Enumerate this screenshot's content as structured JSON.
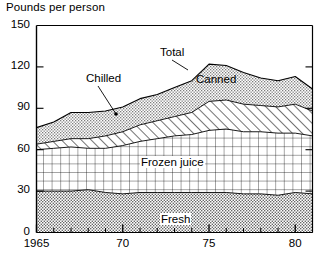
{
  "chart_data": {
    "type": "area",
    "title": "Pounds per person",
    "xlabel": "",
    "ylabel": "Pounds per person",
    "ylim": [
      0,
      150
    ],
    "xlim": [
      1965,
      1981
    ],
    "y_ticks": [
      0,
      30,
      60,
      90,
      120,
      150
    ],
    "x_ticks": [
      1965,
      1970,
      1975,
      1980
    ],
    "x_tick_labels": [
      "1965",
      "70",
      "75",
      "80"
    ],
    "x_minor_tick_interval": 1,
    "grid": false,
    "stacked": true,
    "legend": "inline-annotations",
    "x": [
      1965,
      1966,
      1967,
      1968,
      1969,
      1970,
      1971,
      1972,
      1973,
      1974,
      1975,
      1976,
      1977,
      1978,
      1979,
      1980,
      1981
    ],
    "series": [
      {
        "name": "Fresh",
        "pattern": "dotted",
        "values": [
          30,
          30,
          30,
          31,
          29,
          28,
          29,
          29,
          29,
          29,
          29,
          29,
          28,
          28,
          27,
          29,
          28
        ]
      },
      {
        "name": "Frozen juice",
        "pattern": "grid",
        "values": [
          30,
          31,
          32,
          30,
          32,
          35,
          37,
          39,
          41,
          42,
          45,
          46,
          45,
          45,
          45,
          43,
          42
        ]
      },
      {
        "name": "Chilled",
        "pattern": "diagonal-hatch",
        "values": [
          4,
          5,
          6,
          7,
          9,
          10,
          12,
          13,
          14,
          16,
          21,
          21,
          20,
          19,
          19,
          21,
          18
        ]
      },
      {
        "name": "Canned",
        "pattern": "stipple",
        "values": [
          12,
          14,
          19,
          19,
          18,
          18,
          19,
          19,
          21,
          23,
          27,
          25,
          23,
          20,
          19,
          20,
          16
        ]
      }
    ],
    "cumulative_total": {
      "name": "Total",
      "values": [
        76,
        80,
        87,
        87,
        88,
        91,
        97,
        100,
        105,
        110,
        122,
        121,
        116,
        112,
        110,
        113,
        104
      ]
    },
    "annotations": [
      {
        "name": "Total",
        "label": "Total",
        "x_px": 160,
        "y_px": 46,
        "leader_to_x": 188,
        "leader_to_y": 70
      },
      {
        "name": "Chilled",
        "label": "Chilled",
        "x_px": 86,
        "y_px": 72,
        "leader_to_x": 116,
        "leader_to_y": 114
      },
      {
        "name": "Canned",
        "label": "Canned",
        "x_px": 196,
        "y_px": 73,
        "leader_to_x": 0,
        "leader_to_y": 0
      },
      {
        "name": "Frozen juice",
        "label": "Frozen juice",
        "x_px": 140,
        "y_px": 156,
        "leader_to_x": 0,
        "leader_to_y": 0
      },
      {
        "name": "Fresh",
        "label": "Fresh",
        "x_px": 160,
        "y_px": 213,
        "leader_to_x": 0,
        "leader_to_y": 0
      }
    ],
    "colors": {
      "axis": "#000000",
      "line": "#000000",
      "fresh_fill": "#b9b9b9",
      "frozen_fill": "#ffffff",
      "chilled_fill": "#ffffff",
      "canned_fill": "#d8d8d8",
      "background": "#ffffff"
    }
  }
}
